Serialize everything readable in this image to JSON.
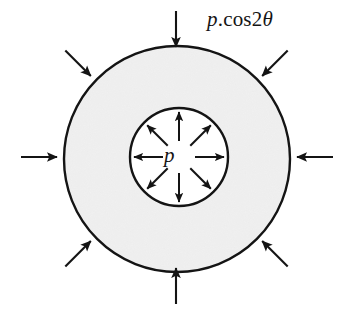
{
  "figure": {
    "background_color": "#ffffff",
    "line_color": "#141414",
    "annulus_fill_color": "#e8e8e8",
    "hole_fill_color": "#ffffff"
  },
  "labels": {
    "outer_pressure": {
      "p": "p",
      "cos": ".cos2",
      "theta": "θ",
      "full_text": "p.cos2θ"
    },
    "inner_pressure": {
      "text": "p"
    }
  },
  "geometry": {
    "outer_circle": {
      "cx": 177,
      "cy": 159,
      "r": 113
    },
    "inner_circle": {
      "cx": 179,
      "cy": 157,
      "r": 49
    },
    "outer_arrow_count": 8,
    "inner_arrow_count": 8,
    "outer_arrow_length": 36,
    "inner_arrow_inner_radius": 16,
    "inner_arrow_outer_radius": 45,
    "outer_arrow_angles_deg": [
      0,
      45,
      90,
      135,
      180,
      225,
      270,
      315
    ],
    "inner_arrow_angles_deg": [
      0,
      45,
      90,
      135,
      180,
      225,
      270,
      315
    ]
  }
}
